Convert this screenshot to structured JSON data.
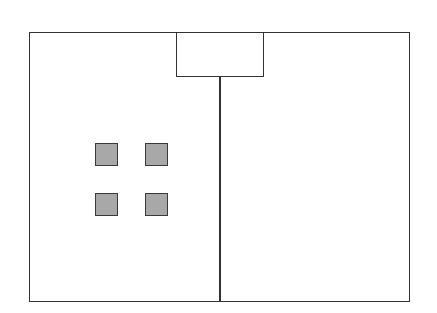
{
  "diagram": {
    "frame": {
      "x": 29,
      "y": 32,
      "width": 381,
      "height": 270,
      "stroke": "#333333"
    },
    "top_box": {
      "x": 176,
      "y": 32,
      "width": 88,
      "height": 45
    },
    "divider": {
      "x": 219,
      "y1": 76,
      "y2": 302
    },
    "squares": [
      {
        "x": 95,
        "y": 143,
        "fill": "#a8a8a8"
      },
      {
        "x": 145,
        "y": 143,
        "fill": "#a8a8a8"
      },
      {
        "x": 95,
        "y": 193,
        "fill": "#a8a8a8"
      },
      {
        "x": 145,
        "y": 193,
        "fill": "#a8a8a8"
      }
    ]
  }
}
